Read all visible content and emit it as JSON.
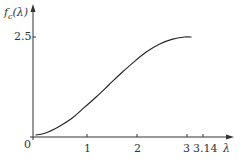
{
  "chart_data": {
    "type": "line",
    "title": "",
    "ylabel": "f_c(λ)",
    "xlabel": "λ",
    "x_ticks": [
      {
        "value": 0,
        "label": "0"
      },
      {
        "value": 1,
        "label": "1"
      },
      {
        "value": 2,
        "label": "2"
      },
      {
        "value": 3,
        "label": "3"
      },
      {
        "value": 3.14,
        "label": "3.14"
      }
    ],
    "y_ticks": [
      {
        "value": 2.5,
        "label": "2.5"
      }
    ],
    "xlim": [
      0,
      3.5
    ],
    "ylim": [
      0,
      2.9
    ],
    "grid": false,
    "series": [
      {
        "name": "f_c(λ)",
        "x": [
          0.05,
          0.25,
          0.5,
          0.75,
          1.0,
          1.25,
          1.5,
          1.75,
          2.0,
          2.25,
          2.5,
          2.75,
          3.0,
          3.14
        ],
        "y": [
          0.05,
          0.1,
          0.25,
          0.45,
          0.72,
          1.0,
          1.3,
          1.6,
          1.88,
          2.13,
          2.32,
          2.44,
          2.5,
          2.5
        ]
      }
    ]
  },
  "labels": {
    "y_axis_name": "f",
    "y_axis_sub": "c",
    "y_axis_arg": "(λ)",
    "x_axis_name": "λ",
    "origin": "0",
    "tick_1": "1",
    "tick_2": "2",
    "tick_3": "3",
    "tick_314": "3.14",
    "tick_y25": "2.5"
  }
}
